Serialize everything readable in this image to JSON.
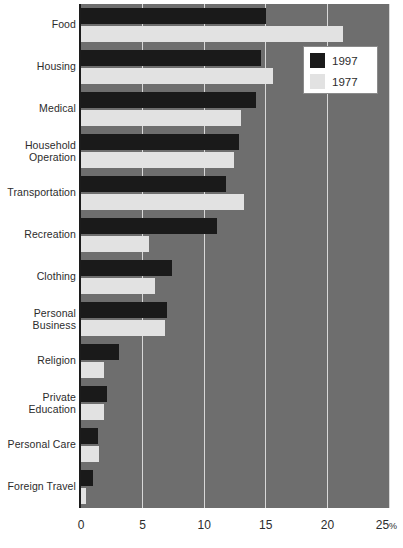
{
  "chart_data": {
    "type": "bar",
    "orientation": "horizontal",
    "title": "",
    "xlabel": "",
    "ylabel": "",
    "xlim": [
      0,
      25
    ],
    "xticks": [
      0,
      5,
      10,
      15,
      20,
      25
    ],
    "xtick_labels": [
      "0",
      "5",
      "10",
      "15",
      "20",
      "25"
    ],
    "xaxis_unit": "%",
    "grid": true,
    "grid_axis": "x",
    "legend_position": "top-right",
    "background_color": "#6e6e6e",
    "categories": [
      "Food",
      "Housing",
      "Medical",
      "Household\nOperation",
      "Transportation",
      "Recreation",
      "Clothing",
      "Personal\nBusiness",
      "Religion",
      "Private\nEducation",
      "Personal Care",
      "Foreign Travel"
    ],
    "series": [
      {
        "name": "1997",
        "color": "#1a1a1a",
        "values": [
          15.0,
          14.6,
          14.2,
          12.8,
          11.8,
          11.0,
          7.4,
          7.0,
          3.1,
          2.1,
          1.4,
          1.0
        ]
      },
      {
        "name": "1977",
        "color": "#e2e2e2",
        "values": [
          21.3,
          15.6,
          13.0,
          12.4,
          13.2,
          5.5,
          6.0,
          6.8,
          1.9,
          1.9,
          1.5,
          0.4
        ]
      }
    ]
  },
  "legend": {
    "items": [
      {
        "label": "1997",
        "color": "#1a1a1a"
      },
      {
        "label": "1977",
        "color": "#e2e2e2"
      }
    ]
  },
  "axis": {
    "tick_0": "0",
    "tick_1": "5",
    "tick_2": "10",
    "tick_3": "15",
    "tick_4": "20",
    "tick_5": "25",
    "percent_sign": "%"
  }
}
